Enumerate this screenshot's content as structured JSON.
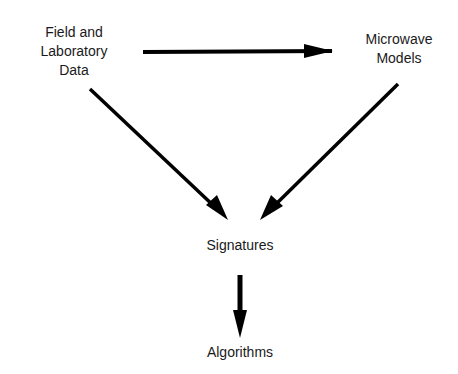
{
  "diagram": {
    "nodes": [
      {
        "id": "field",
        "lines": [
          "Field and",
          "Laboratory",
          "Data"
        ]
      },
      {
        "id": "models",
        "lines": [
          "Microwave",
          "Models"
        ]
      },
      {
        "id": "signatures",
        "lines": [
          "Signatures"
        ]
      },
      {
        "id": "algorithms",
        "lines": [
          "Algorithms"
        ]
      }
    ],
    "edges": [
      {
        "from": "field",
        "to": "models"
      },
      {
        "from": "field",
        "to": "signatures"
      },
      {
        "from": "models",
        "to": "signatures"
      },
      {
        "from": "signatures",
        "to": "algorithms"
      }
    ],
    "colors": {
      "line": "#000000",
      "text": "#1a1a1a",
      "background": "#ffffff"
    }
  }
}
